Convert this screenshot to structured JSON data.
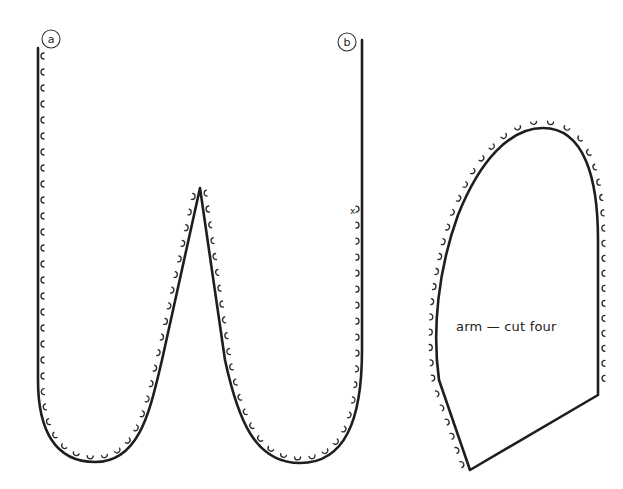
{
  "pieces": [
    {
      "id": "body-piece",
      "markers": [
        {
          "label": "a"
        },
        {
          "label": "b"
        }
      ],
      "notch_mark": "x"
    },
    {
      "id": "arm-piece",
      "label": "arm — cut four"
    }
  ],
  "colors": {
    "line": "#1e1e1e",
    "background": "#ffffff"
  }
}
